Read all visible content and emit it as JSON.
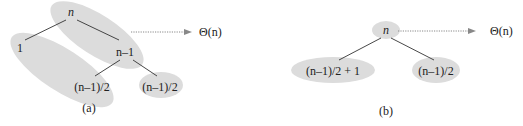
{
  "figure_a": {
    "caption": "(a)",
    "nodes": {
      "root": "n",
      "left_leaf": "1",
      "right_child": "n–1",
      "rc_left": "(n–1)/2",
      "rc_right": "(n–1)/2"
    },
    "cost_label": "Θ(n)"
  },
  "figure_b": {
    "caption": "(b)",
    "nodes": {
      "root": "n",
      "left_child": "(n–1)/2 + 1",
      "right_child": "(n–1)/2"
    },
    "cost_label": "Θ(n)"
  },
  "colors": {
    "highlight": "#dcdcdc",
    "edge": "#333333",
    "arrow": "#888888"
  }
}
